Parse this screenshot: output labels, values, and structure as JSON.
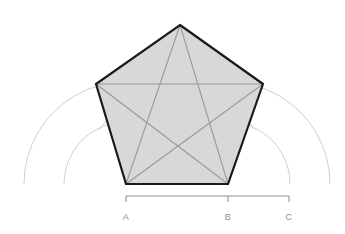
{
  "figure": {
    "canvas": {
      "width": 345,
      "height": 234,
      "background": "#ffffff"
    }
  },
  "colors": {
    "background": "#ffffff",
    "pentagon_fill": "#d8d8d8",
    "pentagon_outline": "#1a1a1a",
    "diagonal_line": "#9a9a9a",
    "construction_arc": "#c9c9c9",
    "faint_chord": "#c0c0c0",
    "dimension_line": "#8e8e8e",
    "label_text": "#8e8e8e"
  },
  "labels": [
    {
      "id": "A",
      "text": "A",
      "x": 126,
      "y": 218
    },
    {
      "id": "B",
      "text": "B",
      "x": 228,
      "y": 218
    },
    {
      "id": "C",
      "text": "C",
      "x": 289,
      "y": 218
    }
  ],
  "dimension_bar": {
    "y": 196,
    "tick_height": 6,
    "start_x": 126,
    "mid_x": 228,
    "end_x": 289,
    "segments": [
      {
        "from": "A",
        "to": "B",
        "length_px": 102
      },
      {
        "from": "B",
        "to": "C",
        "length_px": 61
      }
    ]
  },
  "pentagon": {
    "sides": 5,
    "fill": "#d8d8d8",
    "stroke": "#1a1a1a",
    "stroke_width": 2.2,
    "vertices": [
      {
        "id": "apex",
        "x": 180,
        "y": 25
      },
      {
        "id": "upper-right",
        "x": 263,
        "y": 84
      },
      {
        "id": "lower-right",
        "x": 228,
        "y": 184
      },
      {
        "id": "lower-left",
        "x": 126,
        "y": 184
      },
      {
        "id": "upper-left",
        "x": 96,
        "y": 84
      }
    ]
  },
  "pentagram": {
    "description": "Five diagonals connecting non-adjacent pentagon vertices",
    "stroke": "#9a9a9a",
    "stroke_width": 1.1,
    "diagonals": [
      {
        "from": "apex",
        "to": "lower-right"
      },
      {
        "from": "apex",
        "to": "lower-left"
      },
      {
        "from": "upper-right",
        "to": "lower-left"
      },
      {
        "from": "upper-right",
        "to": "upper-left"
      },
      {
        "from": "lower-right",
        "to": "upper-left"
      }
    ]
  },
  "construction_arcs": [
    {
      "id": "arc-large-left",
      "center_x": 126,
      "center_y": 184,
      "radius": 102,
      "start_deg": 180,
      "end_deg": 300
    },
    {
      "id": "arc-large-right",
      "center_x": 228,
      "center_y": 184,
      "radius": 102,
      "start_deg": 240,
      "end_deg": 360
    },
    {
      "id": "arc-small-left",
      "center_x": 126,
      "center_y": 184,
      "radius": 62,
      "start_deg": 180,
      "end_deg": 300
    },
    {
      "id": "arc-small-right",
      "center_x": 228,
      "center_y": 184,
      "radius": 62,
      "start_deg": 240,
      "end_deg": 360
    },
    {
      "id": "arc-inner",
      "center_x": 177,
      "center_y": 184,
      "radius": 95,
      "start_deg": 215,
      "end_deg": 325
    }
  ],
  "chords": [
    {
      "id": "upper-chord",
      "from_x": 96,
      "from_y": 84,
      "to_x": 263,
      "to_y": 84
    }
  ]
}
